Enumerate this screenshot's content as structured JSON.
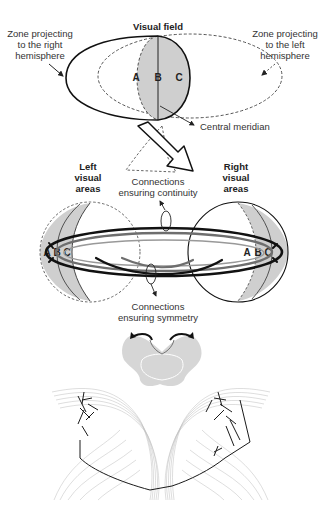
{
  "panel_visual_field": {
    "title": "Visual field",
    "left_label": [
      "Zone projecting",
      "to the right",
      "hemisphere"
    ],
    "right_label": [
      "Zone projecting",
      "to the left",
      "hemisphere"
    ],
    "zones": [
      "A",
      "B",
      "C"
    ],
    "meridian_label": "Central meridian"
  },
  "panel_hemispheres": {
    "left_label": [
      "Left",
      "visual",
      "areas"
    ],
    "right_label": [
      "Right",
      "visual",
      "areas"
    ],
    "continuity_label": [
      "Connections",
      "ensuring continuity"
    ],
    "symmetry_label": [
      "Connections",
      "ensuring symmetry"
    ],
    "left_zones": [
      "A",
      "B",
      "C"
    ],
    "right_zones": [
      "A",
      "B",
      "C"
    ]
  },
  "colors": {
    "shade": "#cfcfcf",
    "dark_stroke": "#111111",
    "mid_stroke": "#6e6e6e",
    "brain_gray": "#d6d6d6",
    "fiber_gray": "#bdbdbd"
  }
}
